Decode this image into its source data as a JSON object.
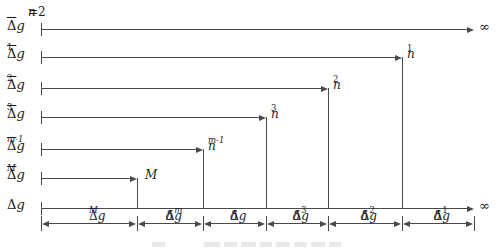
{
  "figure": {
    "colors": {
      "line": "#4a4a4a",
      "text": "#1c1c1c",
      "faint": "#e8e8e8",
      "background": "#ffffff"
    },
    "geometry": {
      "width": 501,
      "height": 248,
      "x_start": 41,
      "axis_y": 208
    },
    "start_note": {
      "it": "n",
      "after": "=2",
      "x": 28,
      "y": 6
    },
    "infinity_symbol": "∞",
    "rows": [
      {
        "name": "row-dg-mean",
        "y": 29,
        "x_end": 474,
        "drop": false,
        "label": {
          "upright": "Δ",
          "it": "g",
          "overline": true
        },
        "end": {
          "text": "∞"
        }
      },
      {
        "name": "row-dg1-mean",
        "y": 57,
        "x_end": 402,
        "drop": true,
        "label": {
          "upright": "Δ",
          "it": "g",
          "overline": true,
          "sub": "1"
        },
        "end": {
          "it": "n",
          "sub": "1"
        }
      },
      {
        "name": "row-dg2-mean",
        "y": 88,
        "x_end": 328,
        "drop": true,
        "label": {
          "upright": "Δ",
          "it": "g",
          "overline": true,
          "sub": "2"
        },
        "end": {
          "it": "n",
          "sub": "2"
        }
      },
      {
        "name": "row-dg3-mean",
        "y": 117,
        "x_end": 266,
        "drop": true,
        "label": {
          "upright": "Δ",
          "it": "g",
          "overline": true,
          "sub": "3"
        },
        "end": {
          "it": "n",
          "sub": "3"
        }
      },
      {
        "name": "row-dgm1-mean",
        "y": 149,
        "x_end": 203,
        "drop": true,
        "label": {
          "upright": "Δ",
          "it": "g",
          "overline": true,
          "sub": "m-1"
        },
        "end": {
          "it": "n",
          "sub": "m-1"
        }
      },
      {
        "name": "row-dgM-mean",
        "y": 178,
        "x_end": 137,
        "drop": true,
        "label": {
          "upright": "Δ",
          "it": "g",
          "overline": true,
          "sub": "M"
        },
        "end": {
          "it": "M"
        },
        "end_dx": 8
      },
      {
        "name": "row-dg-axis",
        "y": 208,
        "x_end": 474,
        "drop": false,
        "label": {
          "upright": "Δ",
          "it": "g"
        },
        "end": {
          "text": "∞"
        }
      }
    ],
    "intervals": {
      "y": 223,
      "tick_top": 216,
      "tick_height": 15,
      "boundaries": [
        41,
        137,
        203,
        266,
        328,
        402,
        474
      ],
      "labels": [
        {
          "upright": "Δ",
          "it": "g",
          "overline": true,
          "sub": "M"
        },
        {
          "pre": "δ",
          "upright": "Δ",
          "it": "g",
          "sub": "m"
        },
        {
          "pre": "δ",
          "upright": "Δ",
          "it": "g"
        },
        {
          "pre": "δ",
          "upright": "Δ",
          "it": "g",
          "sub": "3"
        },
        {
          "pre": "δ",
          "upright": "Δ",
          "it": "g",
          "sub": "2"
        },
        {
          "pre": "δ",
          "upright": "Δ",
          "it": "g",
          "sub": "1"
        }
      ]
    },
    "caption_fragments": [
      {
        "x": 152,
        "w": 13
      },
      {
        "x": 204,
        "w": 16
      },
      {
        "x": 224,
        "w": 13
      },
      {
        "x": 241,
        "w": 15
      },
      {
        "x": 260,
        "w": 12
      },
      {
        "x": 276,
        "w": 14
      },
      {
        "x": 294,
        "w": 13
      },
      {
        "x": 311,
        "w": 14
      },
      {
        "x": 329,
        "w": 12
      }
    ]
  }
}
